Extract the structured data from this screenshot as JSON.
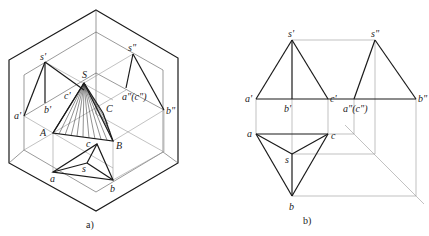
{
  "figure_a": {
    "caption": "a)",
    "labels": {
      "s_prime": "s'",
      "s_double": "s\"",
      "S": "S",
      "c_prime": "c'",
      "b_prime": "b'",
      "a_prime": "a'",
      "C": "C",
      "a_c_double": "a\"(c\")",
      "b_double": "b\"",
      "A": "A",
      "B": "B",
      "c": "c",
      "s": "s",
      "a": "a",
      "b": "b"
    }
  },
  "figure_b": {
    "caption": "b)",
    "labels": {
      "s_prime": "s'",
      "s_double": "s\"",
      "a_prime": "a'",
      "b_prime": "b'",
      "c_prime": "c'",
      "a_c_double": "a\"(c\")",
      "b_double": "b\"",
      "a": "a",
      "c": "c",
      "s": "s",
      "b": "b"
    }
  }
}
